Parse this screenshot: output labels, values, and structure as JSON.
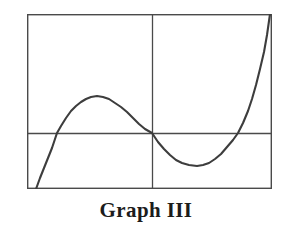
{
  "figure": {
    "caption": "Graph III",
    "caption_color": "#1c1c1c",
    "background_color": "#ffffff"
  },
  "frame": {
    "name": "plot-border",
    "x": 27,
    "y": 14,
    "width": 245,
    "height": 175,
    "stroke_color": "#4a4a4a",
    "stroke_width": 1.4
  },
  "axes": {
    "x_axis": {
      "label": "",
      "y_pixel": 133,
      "x_start": 27,
      "x_end": 272,
      "stroke_color": "#4a4a4a",
      "stroke_width": 1.3
    },
    "y_axis": {
      "label": "",
      "x_pixel": 152,
      "y_start": 14,
      "y_end": 189,
      "stroke_color": "#4a4a4a",
      "stroke_width": 1.3
    },
    "origin": {
      "x": 152,
      "y": 133
    },
    "ticks": [],
    "tick_labels": [],
    "grid": false
  },
  "chart_data": {
    "type": "line",
    "title": "Graph III",
    "xlabel": "",
    "ylabel": "",
    "grid": false,
    "legend": null,
    "axis_ranges": {
      "x_pixels": [
        27,
        272
      ],
      "y_pixels": [
        14,
        189
      ],
      "x_data": [
        -2.55,
        2.55
      ],
      "y_data": [
        -1.6,
        2.0
      ]
    },
    "series": [
      {
        "name": "cubic-curve",
        "color": "#3d3d3d",
        "stroke_width": 2.1,
        "description": "Cubic polynomial with three real roots: rises from bottom-left off-frame, local maximum left of the y-axis, passes through the origin, local minimum right of the y-axis, then rises steeply off the top-right of the frame.",
        "features": {
          "roots_pixels": [
            57,
            152,
            238
          ],
          "local_maximum_pixel": {
            "x": 97,
            "y": 97
          },
          "local_minimum_pixel": {
            "x": 197,
            "y": 166
          },
          "inflection_pixel": {
            "x": 152,
            "y": 133
          },
          "enters_frame_pixel": {
            "x": 36,
            "y": 189
          },
          "exits_frame_pixel": {
            "x": 270,
            "y": 14
          }
        },
        "points_pixels": [
          [
            36,
            189
          ],
          [
            40,
            178
          ],
          [
            44,
            168
          ],
          [
            48,
            158
          ],
          [
            52,
            148
          ],
          [
            57,
            133
          ],
          [
            61,
            126
          ],
          [
            66,
            118
          ],
          [
            71,
            111
          ],
          [
            76,
            106
          ],
          [
            81,
            102
          ],
          [
            86,
            99
          ],
          [
            91,
            97
          ],
          [
            97,
            96
          ],
          [
            103,
            97
          ],
          [
            109,
            99
          ],
          [
            115,
            103
          ],
          [
            121,
            107
          ],
          [
            127,
            112
          ],
          [
            133,
            118
          ],
          [
            139,
            124
          ],
          [
            145,
            129
          ],
          [
            152,
            133
          ],
          [
            158,
            142
          ],
          [
            164,
            149
          ],
          [
            170,
            155
          ],
          [
            176,
            160
          ],
          [
            182,
            163
          ],
          [
            189,
            165
          ],
          [
            197,
            166
          ],
          [
            203,
            165
          ],
          [
            209,
            163
          ],
          [
            215,
            159
          ],
          [
            221,
            154
          ],
          [
            227,
            147
          ],
          [
            233,
            140
          ],
          [
            238,
            133
          ],
          [
            243,
            123
          ],
          [
            248,
            111
          ],
          [
            252,
            99
          ],
          [
            256,
            85
          ],
          [
            260,
            69
          ],
          [
            264,
            52
          ],
          [
            267,
            35
          ],
          [
            270,
            14
          ]
        ]
      }
    ]
  }
}
